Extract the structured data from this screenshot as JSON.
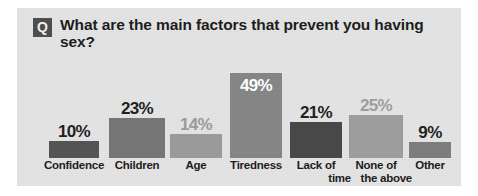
{
  "panel": {
    "background_color": "#e4e4e4"
  },
  "header": {
    "badge_letter": "Q",
    "badge_color": "#4d4d4d",
    "question": "What are the main factors that prevent you having sex?"
  },
  "chart_data": {
    "type": "bar",
    "title": "What are the main factors that prevent you having sex?",
    "xlabel": "",
    "ylabel": "",
    "ylim": [
      0,
      55
    ],
    "grid": false,
    "legend": "none",
    "categories": [
      "Confidence",
      "Children",
      "Age",
      "Tiredness",
      "Lack of time",
      "None of the above",
      "Other"
    ],
    "category_lines": [
      [
        "Confidence"
      ],
      [
        "Children"
      ],
      [
        "Age"
      ],
      [
        "Tiredness"
      ],
      [
        "Lack of",
        "time"
      ],
      [
        "None of",
        "the above"
      ],
      [
        "Other"
      ]
    ],
    "values": [
      10,
      23,
      14,
      49,
      21,
      25,
      9
    ],
    "value_labels": [
      "10%",
      "23%",
      "14%",
      "49%",
      "21%",
      "25%",
      "9%"
    ],
    "bar_colors": [
      "#545454",
      "#767676",
      "#9b9b9b",
      "#868686",
      "#484848",
      "#9e9e9e",
      "#7d7d7d"
    ],
    "label_colors": [
      "#1f1f1f",
      "#1f1f1f",
      "#9b9b9b",
      "#ffffff",
      "#1f1f1f",
      "#9e9e9e",
      "#1f1f1f"
    ],
    "label_placement": [
      "above",
      "above",
      "above",
      "inside",
      "above",
      "above",
      "above"
    ]
  }
}
